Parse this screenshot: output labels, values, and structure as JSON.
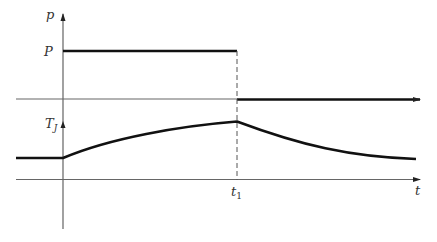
{
  "diagram": {
    "title": "",
    "labels": {
      "p_axis": "p",
      "P_level": "P",
      "Tj_base": "T",
      "Tj_sub": "J",
      "t1_base": "t",
      "t1_sub": "1",
      "t_axis": "t"
    },
    "colors": {
      "axis": "#555555",
      "curve": "#111111",
      "dashed": "#555555",
      "background": "#ffffff"
    },
    "panels": [
      {
        "name": "power-pulse",
        "description": "Power p is constant P from 0 to t1, then drops to 0"
      },
      {
        "name": "junction-temperature",
        "description": "Junction temperature Tj rises during pulse, peaks at t1, then decays back toward initial level"
      }
    ]
  }
}
